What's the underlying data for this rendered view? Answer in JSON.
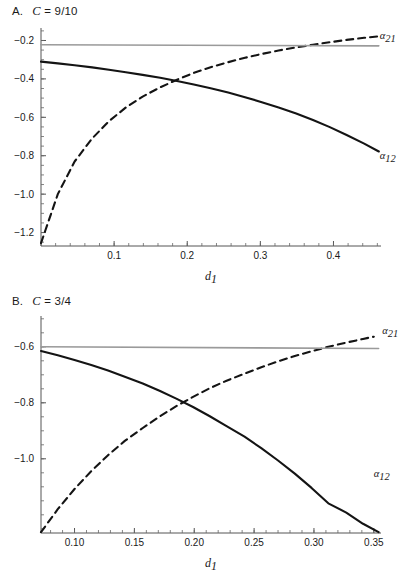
{
  "figure": {
    "panels": [
      {
        "id": "A",
        "letter": "A.",
        "condition_prefix": "C",
        "condition_eq": " = ",
        "condition_value": "9/10"
      },
      {
        "id": "B",
        "letter": "B.",
        "condition_prefix": "C",
        "condition_eq": " = ",
        "condition_value": "3/4"
      }
    ]
  },
  "chart_data": [
    {
      "type": "line",
      "panel": "A",
      "title": "A.  C = 9/10",
      "xlabel": "d",
      "xlabel_sub": "1",
      "ylabel": "",
      "xlim": [
        0.0,
        0.465
      ],
      "ylim": [
        -1.27,
        -0.135
      ],
      "xticks": [
        0.1,
        0.2,
        0.3,
        0.4
      ],
      "xticklabels": [
        "0.1",
        "0.2",
        "0.3",
        "0.4"
      ],
      "yticks": [
        -0.2,
        -0.4,
        -0.6,
        -0.8,
        -1.0,
        -1.2
      ],
      "yticklabels": [
        "-0.2",
        "-0.4",
        "-0.6",
        "-0.8",
        "-1.0",
        "-1.2"
      ],
      "grid": false,
      "legend_position": "inline-right",
      "annotations": [
        {
          "text": "a21",
          "symbol": "α",
          "subscript": "21",
          "x": 0.455,
          "y": -0.175
        },
        {
          "text": "a12",
          "symbol": "α",
          "subscript": "12",
          "x": 0.455,
          "y": -0.8
        }
      ],
      "series": [
        {
          "name": "alpha_12",
          "style": "solid",
          "color": "#141414",
          "x": [
            0.0,
            0.023,
            0.046,
            0.07,
            0.093,
            0.116,
            0.139,
            0.163,
            0.186,
            0.209,
            0.232,
            0.256,
            0.279,
            0.302,
            0.325,
            0.349,
            0.372,
            0.395,
            0.418,
            0.442,
            0.462
          ],
          "y": [
            -0.31,
            -0.319,
            -0.329,
            -0.34,
            -0.352,
            -0.365,
            -0.379,
            -0.394,
            -0.411,
            -0.429,
            -0.449,
            -0.471,
            -0.495,
            -0.521,
            -0.549,
            -0.58,
            -0.614,
            -0.651,
            -0.692,
            -0.737,
            -0.778
          ]
        },
        {
          "name": "alpha_21",
          "style": "dashed",
          "color": "#141414",
          "x": [
            0.0,
            0.023,
            0.046,
            0.07,
            0.093,
            0.116,
            0.139,
            0.163,
            0.186,
            0.209,
            0.232,
            0.256,
            0.279,
            0.302,
            0.325,
            0.349,
            0.372,
            0.395,
            0.418,
            0.442,
            0.462
          ],
          "y": [
            -1.255,
            -1.0,
            -0.83,
            -0.71,
            -0.62,
            -0.549,
            -0.492,
            -0.444,
            -0.404,
            -0.369,
            -0.339,
            -0.313,
            -0.29,
            -0.27,
            -0.252,
            -0.236,
            -0.222,
            -0.209,
            -0.197,
            -0.186,
            -0.178
          ]
        },
        {
          "name": "reference_level",
          "style": "solid",
          "color": "#9a9a9a",
          "x": [
            0.0,
            0.462
          ],
          "y": [
            -0.222,
            -0.228
          ]
        }
      ]
    },
    {
      "type": "line",
      "panel": "B",
      "title": "B.  C = 3/4",
      "xlabel": "d",
      "xlabel_sub": "1",
      "ylabel": "",
      "xlim": [
        0.072,
        0.356
      ],
      "ylim": [
        -1.265,
        -0.49
      ],
      "xticks": [
        0.1,
        0.15,
        0.2,
        0.25,
        0.3,
        0.35
      ],
      "xticklabels": [
        "0.10",
        "0.15",
        "0.20",
        "0.25",
        "0.30",
        "0.35"
      ],
      "yticks": [
        -0.6,
        -0.8,
        -1.0
      ],
      "yticklabels": [
        "-0.6",
        "-0.8",
        "-1.0"
      ],
      "grid": false,
      "legend_position": "inline-right",
      "annotations": [
        {
          "text": "a21",
          "symbol": "α",
          "subscript": "21",
          "x": 0.352,
          "y": -0.545
        },
        {
          "text": "a12",
          "symbol": "α",
          "subscript": "12",
          "x": 0.345,
          "y": -1.055
        }
      ],
      "series": [
        {
          "name": "alpha_12",
          "style": "solid",
          "color": "#141414",
          "x": [
            0.072,
            0.086,
            0.1,
            0.114,
            0.128,
            0.142,
            0.157,
            0.171,
            0.185,
            0.199,
            0.213,
            0.227,
            0.242,
            0.256,
            0.27,
            0.284,
            0.298,
            0.312,
            0.327,
            0.341,
            0.354
          ],
          "y": [
            -0.615,
            -0.63,
            -0.647,
            -0.665,
            -0.685,
            -0.707,
            -0.731,
            -0.757,
            -0.785,
            -0.815,
            -0.848,
            -0.883,
            -0.921,
            -0.962,
            -1.006,
            -1.053,
            -1.104,
            -1.159,
            -1.192,
            -1.232,
            -1.262
          ]
        },
        {
          "name": "alpha_21",
          "style": "dashed",
          "color": "#141414",
          "x": [
            0.072,
            0.086,
            0.1,
            0.114,
            0.128,
            0.142,
            0.157,
            0.171,
            0.185,
            0.199,
            0.213,
            0.227,
            0.242,
            0.256,
            0.27,
            0.284,
            0.298,
            0.312,
            0.327,
            0.341,
            0.35
          ],
          "y": [
            -1.262,
            -1.18,
            -1.108,
            -1.044,
            -0.987,
            -0.936,
            -0.89,
            -0.849,
            -0.812,
            -0.779,
            -0.748,
            -0.721,
            -0.696,
            -0.673,
            -0.652,
            -0.633,
            -0.616,
            -0.6,
            -0.585,
            -0.572,
            -0.564
          ]
        },
        {
          "name": "reference_level",
          "style": "solid",
          "color": "#9a9a9a",
          "x": [
            0.072,
            0.354
          ],
          "y": [
            -0.6,
            -0.606
          ]
        }
      ]
    }
  ]
}
